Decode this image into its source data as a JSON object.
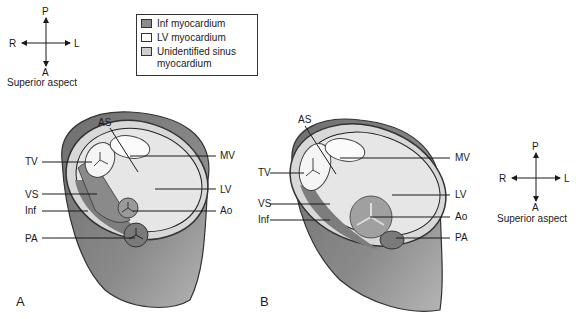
{
  "legend": {
    "items": [
      {
        "label": "Inf myocardium",
        "color": "#8c8c8c"
      },
      {
        "label": "LV myocardium",
        "color": "#ffffff"
      },
      {
        "label": "Unidentified sinus myocardium",
        "color": "#cfcfcf"
      }
    ]
  },
  "compass_left": {
    "p": "P",
    "a": "A",
    "r": "R",
    "l": "L",
    "caption": "Superior aspect"
  },
  "compass_right": {
    "p": "P",
    "a": "A",
    "r": "R",
    "l": "L",
    "caption": "Superior aspect"
  },
  "panel_a": {
    "letter": "A",
    "labels": {
      "as": "AS",
      "tv": "TV",
      "vs": "VS",
      "inf": "Inf",
      "pa": "PA",
      "mv": "MV",
      "lv": "LV",
      "ao": "Ao"
    }
  },
  "panel_b": {
    "letter": "B",
    "labels": {
      "as": "AS",
      "tv": "TV",
      "vs": "VS",
      "inf": "Inf",
      "mv": "MV",
      "lv": "LV",
      "ao": "Ao",
      "pa": "PA"
    }
  },
  "colors": {
    "outer_shell": "#8a8a8a",
    "inner_light": "#e3e3e3",
    "inf_region": "#7d7d7d",
    "rim": "#555555"
  }
}
